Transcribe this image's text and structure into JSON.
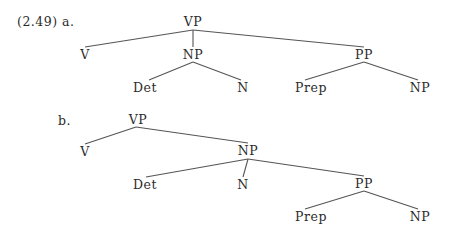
{
  "example_number": "(2.49)",
  "trees": [
    {
      "label": "a.",
      "nodes": {
        "root": "VP",
        "v": "V",
        "np": "NP",
        "det": "Det",
        "n": "N",
        "pp": "PP",
        "prep": "Prep",
        "pp_np": "NP"
      }
    },
    {
      "label": "b.",
      "nodes": {
        "root": "VP",
        "v": "V",
        "np": "NP",
        "det": "Det",
        "n": "N",
        "pp": "PP",
        "prep": "Prep",
        "pp_np": "NP"
      }
    }
  ],
  "colors": {
    "text": "#2b2b2b",
    "line": "#555555"
  }
}
